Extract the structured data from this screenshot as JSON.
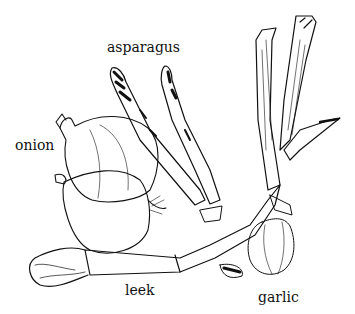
{
  "illustration": {
    "subject": "vegetable sketch",
    "labels": {
      "asparagus": "asparagus",
      "onion": "onion",
      "leek": "leek",
      "garlic": "garlic"
    }
  },
  "colors": {
    "background": "#ffffff",
    "ink": "#111111"
  }
}
